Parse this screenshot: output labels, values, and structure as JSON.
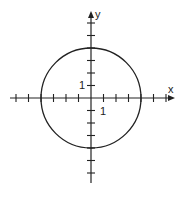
{
  "diagram": {
    "title": "",
    "type": "circle on coordinate axes",
    "axes": {
      "x_label": "x",
      "y_label": "y",
      "x_unit_label": "1",
      "y_unit_label": "1",
      "x_ticks": [
        -6,
        -5,
        -4,
        -3,
        -2,
        -1,
        1,
        2,
        3,
        4,
        5,
        6
      ],
      "y_ticks": [
        -6,
        -5,
        -4,
        -3,
        -2,
        -1,
        1,
        2,
        3,
        4,
        5,
        6
      ]
    },
    "circle": {
      "center": [
        0,
        0
      ],
      "radius": 4
    },
    "colors": {
      "stroke": "#222222",
      "background": "#ffffff"
    }
  }
}
